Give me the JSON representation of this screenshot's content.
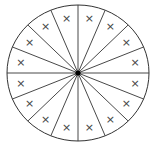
{
  "diagram": {
    "type": "divided-circle",
    "sectors": 16,
    "sector_mark": "×",
    "center": {
      "x": 78,
      "y": 73
    },
    "radius": {
      "x": 71,
      "y": 68
    },
    "stroke_color": "#333333",
    "center_dot_color": "#000000",
    "background": "#ffffff"
  }
}
